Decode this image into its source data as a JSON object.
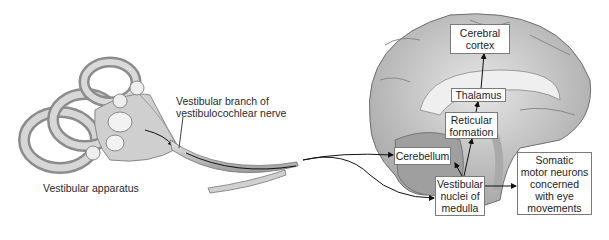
{
  "diagram": {
    "labels": {
      "vestibular_apparatus": "Vestibular apparatus",
      "nerve_branch": "Vestibular branch of\nvestibulocochlear nerve"
    },
    "boxes": {
      "cerebral_cortex": "Cerebral\ncortex",
      "thalamus": "Thalamus",
      "reticular_formation": "Reticular\nformation",
      "cerebellum": "Cerebellum",
      "vestibular_nuclei": "Vestibular\nnuclei of\nmedulla",
      "somatic_motor": "Somatic\nmotor neurons\nconcerned\nwith eye\nmovements"
    },
    "connections": [
      {
        "from": "Vestibular nerve",
        "to": "Cerebellum"
      },
      {
        "from": "Vestibular nerve",
        "to": "Vestibular nuclei of medulla"
      },
      {
        "from": "Vestibular nuclei of medulla",
        "to": "Cerebellum"
      },
      {
        "from": "Vestibular nuclei of medulla",
        "to": "Reticular formation"
      },
      {
        "from": "Reticular formation",
        "to": "Thalamus"
      },
      {
        "from": "Thalamus",
        "to": "Cerebral cortex"
      },
      {
        "from": "Vestibular nuclei of medulla",
        "to": "Somatic motor neurons concerned with eye movements"
      }
    ]
  }
}
